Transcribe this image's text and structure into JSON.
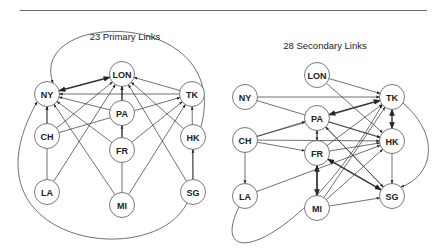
{
  "graphs": [
    {
      "title": "23 Primary Links",
      "nodes": [
        {
          "id": "NY",
          "label": "NY",
          "x": 47,
          "y": 94
        },
        {
          "id": "LON",
          "label": "LON",
          "x": 122,
          "y": 74
        },
        {
          "id": "TK",
          "label": "TK",
          "x": 192,
          "y": 94
        },
        {
          "id": "PA",
          "label": "PA",
          "x": 122,
          "y": 113
        },
        {
          "id": "CH",
          "label": "CH",
          "x": 47,
          "y": 136
        },
        {
          "id": "FR",
          "label": "FR",
          "x": 122,
          "y": 150
        },
        {
          "id": "HK",
          "label": "HK",
          "x": 193,
          "y": 137
        },
        {
          "id": "LA",
          "label": "LA",
          "x": 47,
          "y": 192
        },
        {
          "id": "MI",
          "label": "MI",
          "x": 122,
          "y": 205
        },
        {
          "id": "SG",
          "label": "SG",
          "x": 193,
          "y": 192
        }
      ],
      "edges": [
        {
          "from": "NY",
          "to": "LON",
          "bidirectional": true,
          "bold": true
        },
        {
          "from": "TK",
          "to": "LON"
        },
        {
          "from": "TK",
          "to": "NY"
        },
        {
          "from": "PA",
          "to": "LON"
        },
        {
          "from": "PA",
          "to": "NY"
        },
        {
          "from": "CH",
          "to": "NY"
        },
        {
          "from": "CH",
          "to": "LON"
        },
        {
          "from": "CH",
          "to": "TK"
        },
        {
          "from": "FR",
          "to": "PA"
        },
        {
          "from": "FR",
          "to": "NY"
        },
        {
          "from": "FR",
          "to": "LON"
        },
        {
          "from": "FR",
          "to": "TK"
        },
        {
          "from": "HK",
          "to": "LON"
        },
        {
          "from": "HK",
          "to": "NY",
          "curve": "top"
        },
        {
          "from": "LA",
          "to": "NY"
        },
        {
          "from": "LA",
          "to": "LON"
        },
        {
          "from": "MI",
          "to": "NY"
        },
        {
          "from": "MI",
          "to": "LON"
        },
        {
          "from": "MI",
          "to": "TK"
        },
        {
          "from": "SG",
          "to": "HK"
        },
        {
          "from": "SG",
          "to": "LON"
        },
        {
          "from": "SG",
          "to": "TK"
        },
        {
          "from": "SG",
          "to": "NY",
          "curve": "bottom"
        }
      ]
    },
    {
      "title": "28 Secondary Links",
      "nodes": [
        {
          "id": "LON",
          "label": "LON",
          "x": 317,
          "y": 75
        },
        {
          "id": "NY",
          "label": "NY",
          "x": 245,
          "y": 97
        },
        {
          "id": "TK",
          "label": "TK",
          "x": 392,
          "y": 97
        },
        {
          "id": "PA",
          "label": "PA",
          "x": 317,
          "y": 118
        },
        {
          "id": "CH",
          "label": "CH",
          "x": 245,
          "y": 140
        },
        {
          "id": "FR",
          "label": "FR",
          "x": 317,
          "y": 153
        },
        {
          "id": "HK",
          "label": "HK",
          "x": 392,
          "y": 141
        },
        {
          "id": "LA",
          "label": "LA",
          "x": 245,
          "y": 196
        },
        {
          "id": "MI",
          "label": "MI",
          "x": 317,
          "y": 208
        },
        {
          "id": "SG",
          "label": "SG",
          "x": 392,
          "y": 196
        }
      ],
      "edges": [
        {
          "from": "LON",
          "to": "TK"
        },
        {
          "from": "LON",
          "to": "HK"
        },
        {
          "from": "NY",
          "to": "TK"
        },
        {
          "from": "NY",
          "to": "HK"
        },
        {
          "from": "PA",
          "to": "TK",
          "bidirectional": true,
          "bold": true
        },
        {
          "from": "PA",
          "to": "HK"
        },
        {
          "from": "PA",
          "to": "SG"
        },
        {
          "from": "PA",
          "to": "FR"
        },
        {
          "from": "TK",
          "to": "HK",
          "bidirectional": true,
          "bold": true
        },
        {
          "from": "CH",
          "to": "PA"
        },
        {
          "from": "CH",
          "to": "TK"
        },
        {
          "from": "CH",
          "to": "HK"
        },
        {
          "from": "CH",
          "to": "FR"
        },
        {
          "from": "CH",
          "to": "LA"
        },
        {
          "from": "FR",
          "to": "HK"
        },
        {
          "from": "FR",
          "to": "TK"
        },
        {
          "from": "FR",
          "to": "SG",
          "bidirectional": true,
          "bold": true
        },
        {
          "from": "FR",
          "to": "MI",
          "bidirectional": true,
          "bold": true
        },
        {
          "from": "HK",
          "to": "SG"
        },
        {
          "from": "LA",
          "to": "HK"
        },
        {
          "from": "LA",
          "to": "TK",
          "curve": "bottom"
        },
        {
          "from": "MI",
          "to": "HK"
        },
        {
          "from": "MI",
          "to": "TK"
        },
        {
          "from": "MI",
          "to": "SG"
        },
        {
          "from": "MI",
          "to": "PA"
        },
        {
          "from": "MI",
          "to": "FR"
        },
        {
          "from": "TK",
          "to": "SG",
          "curve": "right"
        },
        {
          "from": "SG",
          "to": "PA"
        }
      ]
    }
  ],
  "colors": {
    "line": "#333333",
    "node_stroke": "#555555",
    "text": "#222222"
  }
}
